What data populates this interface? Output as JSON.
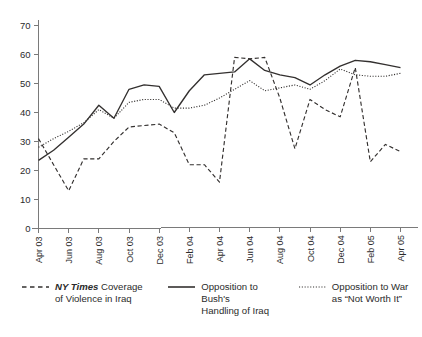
{
  "chart_data": {
    "type": "line",
    "title": "",
    "subtitle": "",
    "xlabel": "",
    "ylabel": "",
    "ylim": [
      0,
      70
    ],
    "yticks": [
      0,
      10,
      20,
      30,
      40,
      50,
      60,
      70
    ],
    "grid": false,
    "legend_position": "bottom",
    "xtick_labels": [
      "Apr 03",
      "Jun 03",
      "Aug 03",
      "Oct 03",
      "Dec 03",
      "Feb 04",
      "Apr 04",
      "Jun 04",
      "Aug 04",
      "Oct 04",
      "Dec 04",
      "Feb 05",
      "Apr 05"
    ],
    "x": [
      "Apr 03",
      "May 03",
      "Jun 03",
      "Jul 03",
      "Aug 03",
      "Sep 03",
      "Oct 03",
      "Nov 03",
      "Dec 03",
      "Jan 04",
      "Feb 04",
      "Mar 04",
      "Apr 04",
      "May 04",
      "Jun 04",
      "Jul 04",
      "Aug 04",
      "Sep 04",
      "Oct 04",
      "Nov 04",
      "Dec 04",
      "Jan 05",
      "Feb 05",
      "Mar 05",
      "Apr 05"
    ],
    "series": [
      {
        "name": "NY Times Coverage of Violence in Iraq",
        "style": "dashed",
        "color": "#33302f",
        "values": [
          31,
          22,
          13,
          24,
          24,
          30,
          35,
          35.5,
          36,
          33,
          22,
          22,
          16,
          59,
          58.5,
          59,
          45,
          27.5,
          44.5,
          41,
          38.5,
          55.5,
          23,
          29,
          26.5
        ]
      },
      {
        "name": "Opposition to Bush's Handling of Iraq",
        "style": "solid",
        "color": "#33302f",
        "values": [
          23.5,
          27,
          31.5,
          36,
          42.5,
          38,
          48,
          49.5,
          49,
          40,
          47.5,
          53,
          53.5,
          54,
          58.5,
          54.5,
          53,
          52,
          49.5,
          53,
          56,
          58,
          57.5,
          56.5,
          55.5
        ]
      },
      {
        "name": "Opposition to War as \"Not Worth It\"",
        "style": "dotted",
        "color": "#33302f",
        "values": [
          28,
          31,
          33.5,
          36.5,
          41,
          38,
          43.5,
          44.5,
          44.5,
          41.5,
          41.5,
          42.5,
          45,
          48,
          51,
          47.5,
          48.5,
          49.5,
          48,
          51,
          55,
          53,
          52.5,
          52.5,
          53.5
        ]
      }
    ]
  },
  "legend": {
    "entries": [
      {
        "style": "dashed",
        "line1_em": "NY Times",
        "line1_rest": " Coverage",
        "line2": "of Violence in Iraq"
      },
      {
        "style": "solid",
        "line1_em": "",
        "line1_rest": "Opposition to Bush's",
        "line2": "Handling of Iraq"
      },
      {
        "style": "dotted",
        "line1_em": "",
        "line1_rest": "Opposition to War",
        "line2": "as “Not Worth It”"
      }
    ]
  },
  "axes": {
    "axis_color": "#7a7a7a"
  }
}
